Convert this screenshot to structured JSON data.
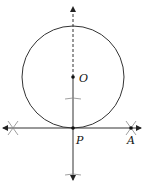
{
  "diagram": {
    "type": "geometric-construction",
    "points": {
      "O": {
        "label": "O",
        "x": 73,
        "y": 77
      },
      "P": {
        "label": "P",
        "x": 73,
        "y": 128
      },
      "A": {
        "label": "A",
        "x": 131,
        "y": 128
      }
    },
    "circle": {
      "center": "O",
      "cx": 73,
      "cy": 77,
      "r": 51
    },
    "lines": [
      {
        "name": "ray-OP-extended-up",
        "style": "dashed",
        "from": [
          73,
          77
        ],
        "to": [
          73,
          6
        ],
        "arrow": "end"
      },
      {
        "name": "line-OP-down",
        "style": "solid",
        "from": [
          73,
          77
        ],
        "to": [
          73,
          180
        ],
        "arrow": "end"
      },
      {
        "name": "tangent-line",
        "style": "solid",
        "from": [
          140,
          128
        ],
        "to": [
          3,
          128
        ],
        "arrow": "both"
      }
    ],
    "arc_marks": [
      {
        "name": "arc-mark-left",
        "x": 13,
        "y": 128,
        "shape": "cross"
      },
      {
        "name": "arc-mark-right",
        "x": 131,
        "y": 128,
        "shape": "cross"
      },
      {
        "name": "arc-mark-upper",
        "x": 73,
        "y": 98,
        "shape": "tick"
      },
      {
        "name": "arc-mark-lower",
        "x": 73,
        "y": 174,
        "shape": "tick"
      }
    ],
    "colors": {
      "stroke": "#333333",
      "marks": "#888888",
      "text": "#111111"
    }
  }
}
